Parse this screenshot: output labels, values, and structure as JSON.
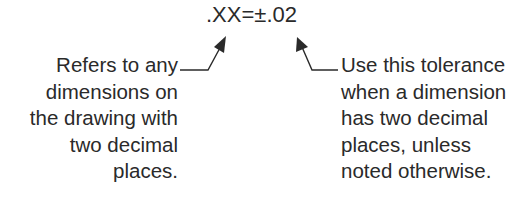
{
  "tolerance_callout": {
    "prefix": ".XX=",
    "symbol": "±",
    "value": ".02"
  },
  "left_note": {
    "lines": [
      "Refers to any",
      "dimensions on",
      "the drawing with",
      "two decimal",
      "places."
    ]
  },
  "right_note": {
    "lines": [
      "Use this tolerance",
      "when a dimension",
      "has two decimal",
      "places, unless",
      "noted otherwise."
    ]
  },
  "colors": {
    "text": "#2a2a2a",
    "leader": "#2a2a2a",
    "background": "#ffffff"
  }
}
